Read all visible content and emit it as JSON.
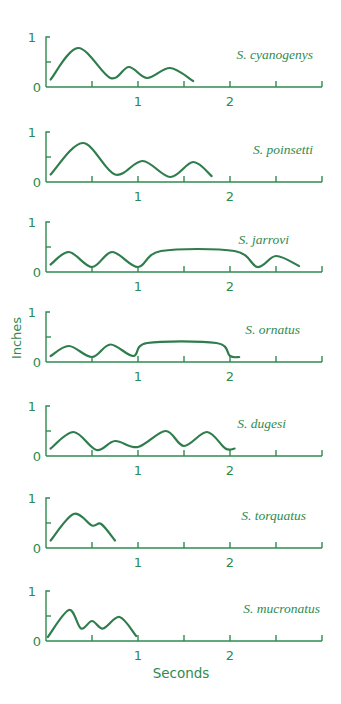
{
  "chart_data": {
    "type": "line",
    "title": "",
    "xlabel": "Seconds",
    "ylabel": "Inches",
    "xlim": [
      0,
      3
    ],
    "ylim": [
      0,
      1
    ],
    "x_ticks": [
      0.5,
      1,
      1.5,
      2,
      2.5,
      3
    ],
    "x_tick_labels": [
      "1",
      "2"
    ],
    "y_tick_labels": [
      "0",
      "1"
    ],
    "grid": false,
    "legend": "none (species names shown as in-panel labels)",
    "color": "#2e8b50",
    "panels": [
      {
        "name": "S. cyanogenys",
        "x": [
          0.05,
          0.35,
          0.7,
          0.9,
          1.1,
          1.35,
          1.6
        ],
        "y": [
          0.15,
          0.78,
          0.18,
          0.4,
          0.18,
          0.38,
          0.12
        ]
      },
      {
        "name": "S. poinsetti",
        "x": [
          0.05,
          0.4,
          0.75,
          1.05,
          1.35,
          1.6,
          1.8
        ],
        "y": [
          0.15,
          0.78,
          0.15,
          0.42,
          0.1,
          0.4,
          0.12
        ]
      },
      {
        "name": "S. jarrovi",
        "x": [
          0.05,
          0.25,
          0.5,
          0.72,
          1.0,
          1.25,
          2.05,
          2.3,
          2.5,
          2.75
        ],
        "y": [
          0.15,
          0.4,
          0.1,
          0.4,
          0.1,
          0.42,
          0.42,
          0.1,
          0.32,
          0.12
        ]
      },
      {
        "name": "S. ornatus",
        "x": [
          0.05,
          0.25,
          0.5,
          0.7,
          0.95,
          1.1,
          1.85,
          2.0,
          2.1
        ],
        "y": [
          0.12,
          0.32,
          0.1,
          0.35,
          0.12,
          0.38,
          0.38,
          0.12,
          0.1
        ]
      },
      {
        "name": "S. dugesi",
        "x": [
          0.05,
          0.3,
          0.55,
          0.75,
          1.0,
          1.3,
          1.5,
          1.75,
          1.95,
          2.05
        ],
        "y": [
          0.15,
          0.48,
          0.12,
          0.3,
          0.18,
          0.5,
          0.2,
          0.48,
          0.15,
          0.15
        ]
      },
      {
        "name": "S. torquatus",
        "x": [
          0.05,
          0.3,
          0.5,
          0.6,
          0.75
        ],
        "y": [
          0.15,
          0.68,
          0.45,
          0.48,
          0.15
        ]
      },
      {
        "name": "S. mucronatus",
        "x": [
          0.02,
          0.25,
          0.38,
          0.5,
          0.62,
          0.8,
          0.98
        ],
        "y": [
          0.08,
          0.62,
          0.25,
          0.4,
          0.25,
          0.48,
          0.1
        ]
      }
    ]
  },
  "labels": {
    "xlabel": "Seconds",
    "ylabel": "Inches",
    "y_one": "1",
    "y_zero": "0",
    "x_one": "1",
    "x_two": "2"
  }
}
